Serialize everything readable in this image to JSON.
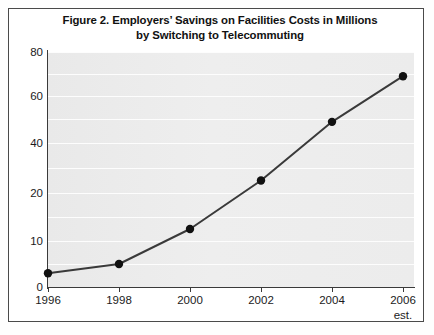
{
  "figure": {
    "title_line_1": "Figure 2. Employers’ Savings on Facilities Costs in Millions",
    "title_line_2": "by Switching to Telecommuting"
  },
  "chart_data": {
    "type": "line",
    "title": "Figure 2. Employers’ Savings on Facilities Costs in Millions by Switching to Telecommuting",
    "subtitle": "",
    "xlabel": "",
    "ylabel": "",
    "categories": [
      "1996",
      "1998",
      "2000",
      "2002",
      "2004",
      "2006"
    ],
    "x_tick_sublabels": [
      "",
      "",
      "",
      "",
      "",
      "est."
    ],
    "values": [
      3,
      5,
      12.5,
      25,
      49,
      69
    ],
    "series": [
      {
        "name": "Employers' savings on facilities costs (millions)",
        "values": [
          3,
          5,
          12.5,
          25,
          49,
          69
        ]
      }
    ],
    "y_tick_labels": [
      "0",
      "10",
      "20",
      "40",
      "60",
      "80"
    ],
    "y_tick_values": [
      0,
      10,
      20,
      40,
      60,
      80
    ],
    "ylim": [
      0,
      80
    ],
    "grid": true,
    "grid_axis": "y",
    "legend": "none",
    "marker": "filled-circle",
    "line_color": "#3a3a3a",
    "marker_color": "#111111",
    "plot_background": "#ededed",
    "gridline_color": "#fdfdfd"
  }
}
